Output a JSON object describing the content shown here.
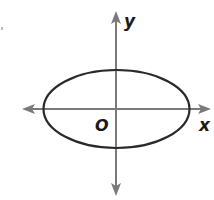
{
  "diagram": {
    "type": "ellipse-on-coordinate-plane",
    "axes": {
      "x_label": "x",
      "y_label": "y",
      "origin_label": "O",
      "axis_color": "#7a7a7a"
    },
    "ellipse": {
      "orientation": "horizontal major axis",
      "stroke_color": "#2a2a2a"
    }
  }
}
